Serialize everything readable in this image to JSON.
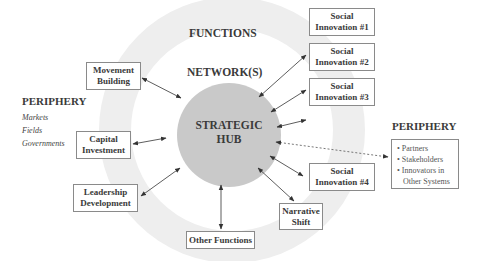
{
  "diagram": {
    "type": "hub-and-spoke",
    "ring_labels": {
      "outer": "FUNCTIONS",
      "inner": "NETWORK(S)"
    },
    "hub": {
      "line1": "STRATEGIC",
      "line2": "HUB"
    },
    "periphery_left": {
      "title": "PERIPHERY",
      "items": [
        "Markets",
        "Fields",
        "Governments"
      ]
    },
    "periphery_right": {
      "title": "PERIPHERY",
      "items": [
        "Partners",
        "Stakeholders",
        "Innovators in",
        "Other Systems"
      ],
      "bullet": "•"
    },
    "functions": [
      {
        "line1": "Movement",
        "line2": "Building"
      },
      {
        "line1": "Capital",
        "line2": "Investment"
      },
      {
        "line1": "Leadership",
        "line2": "Development"
      },
      {
        "line1": "Other Functions",
        "line2": ""
      },
      {
        "line1": "Narrative",
        "line2": "Shift"
      }
    ],
    "social_innovations": [
      {
        "line1": "Social",
        "line2": "Innovation #1"
      },
      {
        "line1": "Social",
        "line2": "Innovation #2"
      },
      {
        "line1": "Social",
        "line2": "Innovation #3"
      },
      {
        "line1": "Social",
        "line2": "Innovation #4"
      }
    ],
    "colors": {
      "ring": "#eeeeee",
      "hub": "#c8c8c8",
      "box_border": "#8a8a8a",
      "text": "#3a3a3a",
      "arrow": "#333333"
    }
  }
}
